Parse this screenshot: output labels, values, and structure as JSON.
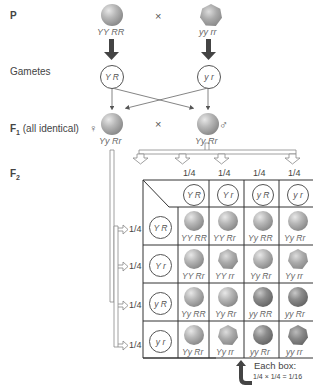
{
  "labels": {
    "p": "P",
    "gametes": "Gametes",
    "f1_prefix": "F",
    "f1_sub": "1",
    "f1_note": " (all identical)",
    "f2_prefix": "F",
    "f2_sub": "2",
    "cross": "×"
  },
  "parents": {
    "left": {
      "genotype": "YY RR",
      "phenotype": "round-yellow"
    },
    "right": {
      "genotype": "yy rr",
      "phenotype": "wrinkled-green"
    }
  },
  "parent_gametes": {
    "left": "Y R",
    "right": "y r"
  },
  "f1": {
    "female": {
      "symbol": "♀",
      "genotype": "Yy Rr"
    },
    "male": {
      "symbol": "♂",
      "genotype": "Yy Rr"
    }
  },
  "punnett": {
    "col_freqs": [
      "1/4",
      "1/4",
      "1/4",
      "1/4"
    ],
    "row_freqs": [
      "1/4",
      "1/4",
      "1/4",
      "1/4"
    ],
    "col_gametes": [
      "Y R",
      "Y r",
      "y R",
      "y r"
    ],
    "row_gametes": [
      "Y R",
      "Y r",
      "y R",
      "y r"
    ],
    "cells": [
      [
        {
          "g": "YY RR",
          "s": "round",
          "c": "light"
        },
        {
          "g": "YY Rr",
          "s": "round",
          "c": "light"
        },
        {
          "g": "Yy RR",
          "s": "round",
          "c": "light"
        },
        {
          "g": "Yy Rr",
          "s": "round",
          "c": "light"
        }
      ],
      [
        {
          "g": "YY Rr",
          "s": "round",
          "c": "light"
        },
        {
          "g": "YY rr",
          "s": "wrinkled",
          "c": "light"
        },
        {
          "g": "Yy Rr",
          "s": "round",
          "c": "light"
        },
        {
          "g": "Yy rr",
          "s": "wrinkled",
          "c": "light"
        }
      ],
      [
        {
          "g": "Yy RR",
          "s": "round",
          "c": "light"
        },
        {
          "g": "Yy Rr",
          "s": "round",
          "c": "light"
        },
        {
          "g": "yy RR",
          "s": "round",
          "c": "dark"
        },
        {
          "g": "yy Rr",
          "s": "round",
          "c": "dark"
        }
      ],
      [
        {
          "g": "Yy Rr",
          "s": "round",
          "c": "light"
        },
        {
          "g": "Yy rr",
          "s": "wrinkled",
          "c": "light"
        },
        {
          "g": "yy Rr",
          "s": "round",
          "c": "dark"
        },
        {
          "g": "yy rr",
          "s": "wrinkled",
          "c": "dark"
        }
      ]
    ]
  },
  "note": {
    "line1": "Each box:",
    "line2": "1/4 × 1/4 = 1/16"
  }
}
